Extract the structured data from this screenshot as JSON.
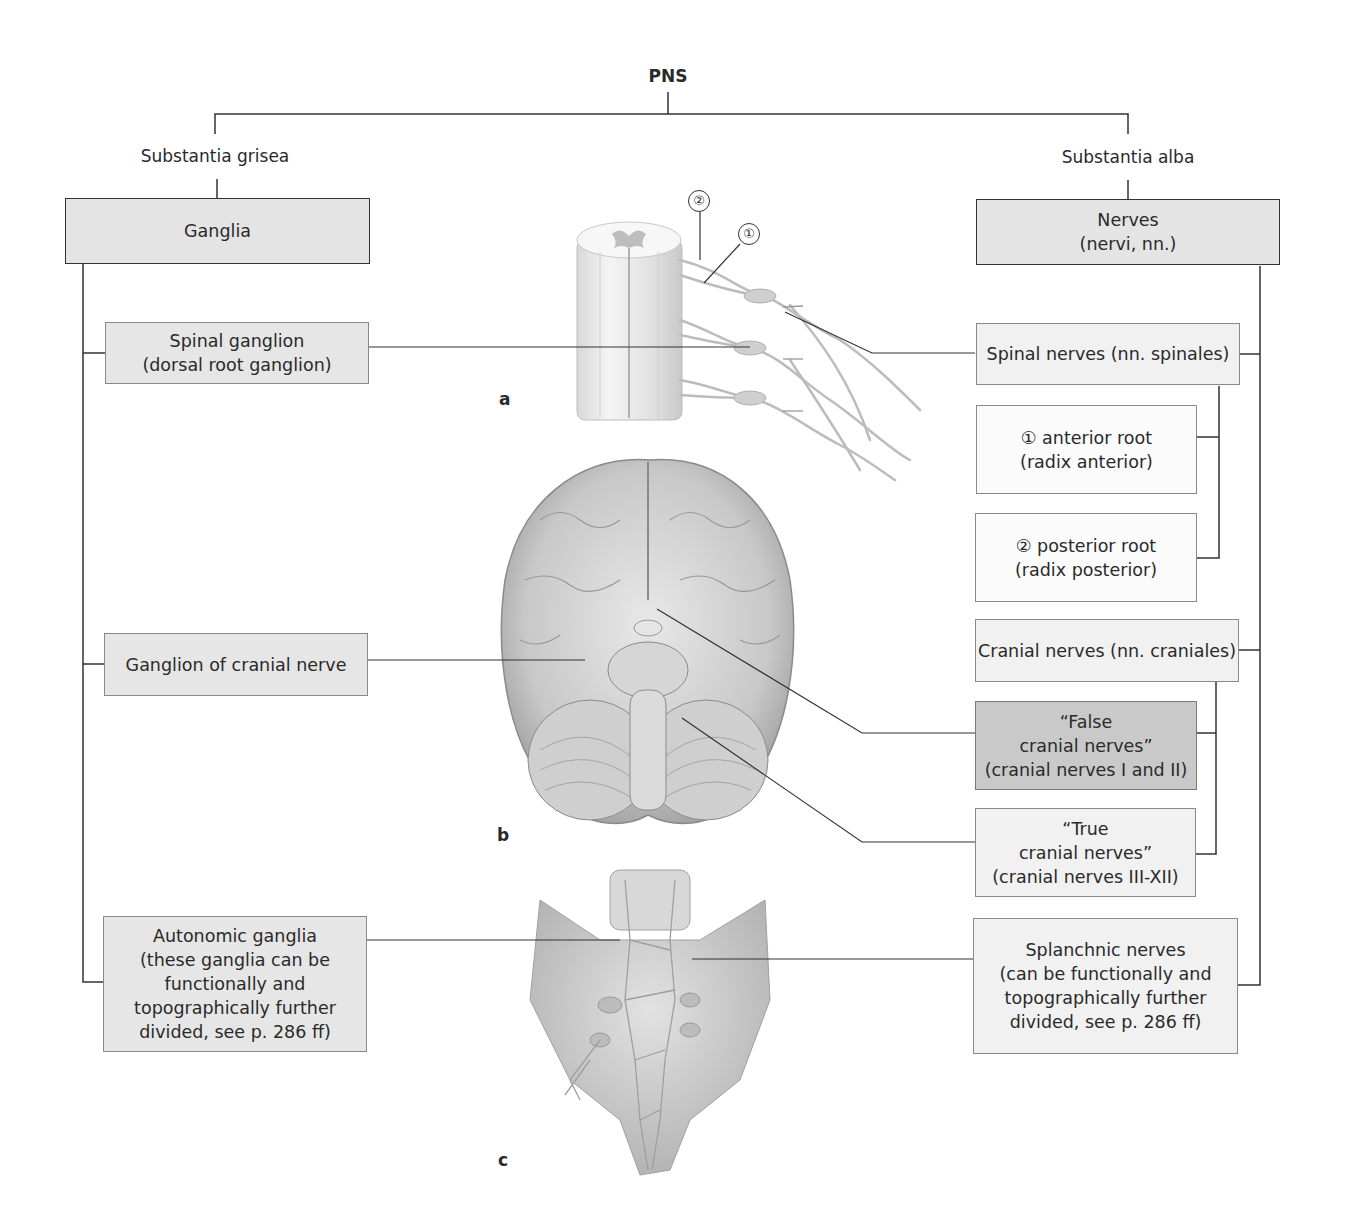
{
  "diagram": {
    "root": "PNS",
    "left_branch": {
      "heading": "Substantia grisea",
      "main_box": "Ganglia",
      "children": [
        {
          "label": "Spinal ganglion\n(dorsal root ganglion)"
        },
        {
          "label": "Ganglion of cranial nerve"
        },
        {
          "label": "Autonomic ganglia\n(these ganglia can be\nfunctionally and\ntopographically further\ndivided, see p. 286 ff)"
        }
      ]
    },
    "right_branch": {
      "heading": "Substantia alba",
      "main_box": "Nerves\n(nervi, nn.)",
      "children": [
        {
          "label": "Spinal nerves (nn. spinales)",
          "sub": [
            {
              "label": "① anterior root\n(radix anterior)"
            },
            {
              "label": "② posterior root\n(radix posterior)"
            }
          ]
        },
        {
          "label": "Cranial nerves (nn. craniales)",
          "sub": [
            {
              "label": "“False\ncranial nerves”\n(cranial nerves I and II)"
            },
            {
              "label": "“True\ncranial nerves”\n(cranial nerves  III-XII)"
            }
          ]
        },
        {
          "label": "Splanchnic nerves\n(can be functionally and\ntopographically further\ndivided, see p. 286 ff)"
        }
      ]
    },
    "figures": {
      "a": {
        "letter": "a",
        "subject": "spinal cord segment with roots",
        "markers": [
          "①",
          "②"
        ]
      },
      "b": {
        "letter": "b",
        "subject": "brain, inferior view"
      },
      "c": {
        "letter": "c",
        "subject": "sacrum with autonomic plexus"
      }
    },
    "colors": {
      "line": "#333333",
      "box_main": "#e4e4e4",
      "box_light": "#f1f1f1",
      "box_white": "#fbfbfb",
      "box_dark": "#c9c9c9"
    }
  }
}
